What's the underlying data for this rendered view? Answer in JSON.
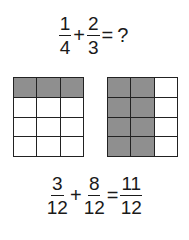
{
  "problem": {
    "fraction1": {
      "num": "1",
      "den": "4"
    },
    "plus": "+",
    "fraction2": {
      "num": "2",
      "den": "3"
    },
    "equals": "=",
    "result": "?"
  },
  "grids": {
    "left": {
      "rows": 4,
      "cols": 3,
      "shaded_rows": [
        0
      ],
      "shaded_count": 3,
      "colors": {
        "shaded": "#8f8f8f",
        "empty": "#ffffff",
        "line": "#222222"
      }
    },
    "right": {
      "rows": 4,
      "cols": 3,
      "shaded_cols": [
        0,
        1
      ],
      "shaded_count": 8,
      "colors": {
        "shaded": "#8f8f8f",
        "empty": "#ffffff",
        "line": "#222222"
      }
    }
  },
  "solution": {
    "fraction1": {
      "num": "3",
      "den": "12"
    },
    "plus": "+",
    "fraction2": {
      "num": "8",
      "den": "12"
    },
    "equals": "=",
    "result": {
      "num": "11",
      "den": "12"
    }
  }
}
